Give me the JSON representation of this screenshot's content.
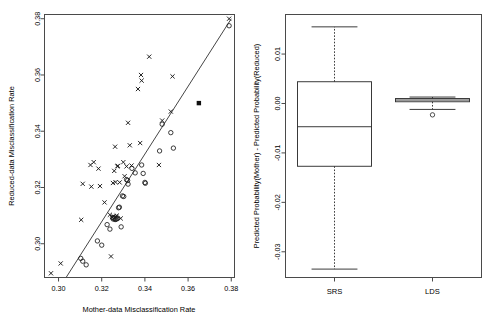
{
  "figure": {
    "width": 494,
    "height": 325,
    "background": "#ffffff",
    "foreground": "#1a1a1a"
  },
  "chart_data": [
    {
      "type": "scatter",
      "panel": "left",
      "title": "",
      "xlabel": "Mother-data Misclassification Rate",
      "ylabel": "Reduced-data Misclassification Rate",
      "xlim": [
        0.2935,
        0.3815
      ],
      "ylim": [
        0.288,
        0.3815
      ],
      "xticks": [
        0.3,
        0.32,
        0.34,
        0.36,
        0.38
      ],
      "xticklabels": [
        "0.30",
        "0.32",
        "0.34",
        "0.36",
        "0.38"
      ],
      "yticks": [
        0.3,
        0.32,
        0.34,
        0.36,
        0.38
      ],
      "yticklabels": [
        "0.30",
        "0.32",
        "0.34",
        "0.36",
        "0.38"
      ],
      "grid": false,
      "legend": "none",
      "annotations": [
        {
          "kind": "reference-line",
          "label": "identity line y = x",
          "from": [
            0.3035,
            0.288
          ],
          "to": [
            0.38,
            0.38
          ]
        }
      ],
      "series": [
        {
          "name": "x-marker group",
          "marker": "x",
          "points": [
            [
              0.2965,
              0.2895
            ],
            [
              0.301,
              0.293
            ],
            [
              0.3105,
              0.3085
            ],
            [
              0.3112,
              0.3213
            ],
            [
              0.3148,
              0.328
            ],
            [
              0.3152,
              0.3203
            ],
            [
              0.3163,
              0.329
            ],
            [
              0.3185,
              0.3267
            ],
            [
              0.3192,
              0.3205
            ],
            [
              0.3213,
              0.3147
            ],
            [
              0.3238,
              0.3103
            ],
            [
              0.3243,
              0.2955
            ],
            [
              0.3248,
              0.3095
            ],
            [
              0.3252,
              0.3216
            ],
            [
              0.3255,
              0.3097
            ],
            [
              0.3258,
              0.3259
            ],
            [
              0.3262,
              0.3345
            ],
            [
              0.3264,
              0.3219
            ],
            [
              0.3266,
              0.3097
            ],
            [
              0.327,
              0.31
            ],
            [
              0.3272,
              0.3275
            ],
            [
              0.3275,
              0.3277
            ],
            [
              0.3283,
              0.3218
            ],
            [
              0.3288,
              0.309
            ],
            [
              0.33,
              0.329
            ],
            [
              0.3306,
              0.324
            ],
            [
              0.3315,
              0.3275
            ],
            [
              0.3322,
              0.343
            ],
            [
              0.333,
              0.335
            ],
            [
              0.3338,
              0.3278
            ],
            [
              0.3368,
              0.355
            ],
            [
              0.3378,
              0.3358
            ],
            [
              0.3382,
              0.36
            ],
            [
              0.3385,
              0.358
            ],
            [
              0.342,
              0.3665
            ],
            [
              0.3465,
              0.328
            ],
            [
              0.348,
              0.3438
            ],
            [
              0.352,
              0.347
            ],
            [
              0.3528,
              0.3595
            ],
            [
              0.379,
              0.38
            ]
          ]
        },
        {
          "name": "o-marker group",
          "marker": "o",
          "points": [
            [
              0.3103,
              0.2948
            ],
            [
              0.3112,
              0.2938
            ],
            [
              0.3128,
              0.2925
            ],
            [
              0.318,
              0.301
            ],
            [
              0.32,
              0.2995
            ],
            [
              0.3225,
              0.3068
            ],
            [
              0.3238,
              0.3052
            ],
            [
              0.325,
              0.3093
            ],
            [
              0.3253,
              0.3088
            ],
            [
              0.3258,
              0.309
            ],
            [
              0.3262,
              0.3086
            ],
            [
              0.3266,
              0.3087
            ],
            [
              0.327,
              0.3089
            ],
            [
              0.3274,
              0.3091
            ],
            [
              0.3278,
              0.3128
            ],
            [
              0.3282,
              0.313
            ],
            [
              0.329,
              0.306
            ],
            [
              0.3296,
              0.317
            ],
            [
              0.3302,
              0.3168
            ],
            [
              0.3315,
              0.3228
            ],
            [
              0.332,
              0.3225
            ],
            [
              0.3322,
              0.3212
            ],
            [
              0.334,
              0.3268
            ],
            [
              0.3355,
              0.3252
            ],
            [
              0.3385,
              0.328
            ],
            [
              0.3392,
              0.325
            ],
            [
              0.34,
              0.3218
            ],
            [
              0.3402,
              0.3215
            ],
            [
              0.3468,
              0.333
            ],
            [
              0.348,
              0.3425
            ],
            [
              0.352,
              0.3395
            ],
            [
              0.3532,
              0.334
            ],
            [
              0.379,
              0.3775
            ]
          ]
        },
        {
          "name": "filled-square point",
          "marker": "square",
          "points": [
            [
              0.365,
              0.35
            ]
          ]
        }
      ]
    },
    {
      "type": "boxplot",
      "panel": "right",
      "title": "",
      "xlabel": "",
      "ylabel": "Predicted Probability(Mother) - Predicted Probability(Reduced)",
      "ylim": [
        -0.0352,
        0.018
      ],
      "yticks": [
        0.01,
        0.0,
        -0.01,
        -0.02,
        -0.03
      ],
      "yticklabels": [
        "0.01",
        "0.00",
        "-0.01",
        "-0.02",
        "-0.03"
      ],
      "categories": [
        "SRS",
        "LDS"
      ],
      "grid": false,
      "legend": "none",
      "boxes": [
        {
          "name": "SRS",
          "min": -0.0335,
          "q1": -0.0127,
          "median": -0.0047,
          "q3": 0.0044,
          "max": 0.0155,
          "outliers": []
        },
        {
          "name": "LDS",
          "min": -0.0012,
          "q1": 0.00035,
          "median": 0.0007,
          "q3": 0.001,
          "max": 0.0013,
          "outliers": [
            -0.0023
          ]
        }
      ]
    }
  ],
  "labels": {
    "left_panel_name": "scatter-panel",
    "right_panel_name": "boxplot-panel"
  }
}
